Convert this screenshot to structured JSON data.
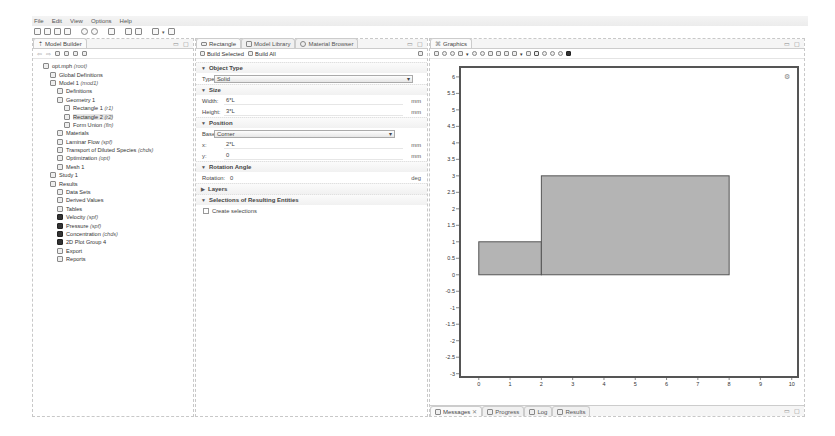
{
  "menu": [
    "File",
    "Edit",
    "View",
    "Options",
    "Help"
  ],
  "toolbar_icons": [
    "new-icon",
    "open-icon",
    "save-icon",
    "print-icon",
    "undo-icon",
    "redo-icon",
    "settings-icon",
    "layout-icon",
    "window-icon",
    "brush-icon",
    "dropdown-icon",
    "grid-icon"
  ],
  "model_builder": {
    "tab": "Model Builder",
    "tree": [
      {
        "label": "opt.mph",
        "tag": "(root)",
        "indent": 0,
        "icon": "root-icon"
      },
      {
        "label": "Global Definitions",
        "tag": "",
        "indent": 1,
        "icon": "global-definitions-icon"
      },
      {
        "label": "Model 1",
        "tag": "(mod1)",
        "indent": 1,
        "icon": "model-icon"
      },
      {
        "label": "Definitions",
        "tag": "",
        "indent": 2,
        "icon": "definitions-icon"
      },
      {
        "label": "Geometry 1",
        "tag": "",
        "indent": 2,
        "icon": "geometry-icon"
      },
      {
        "label": "Rectangle 1",
        "tag": "(r1)",
        "indent": 3,
        "icon": "rectangle-icon"
      },
      {
        "label": "Rectangle 2",
        "tag": "(r2)",
        "indent": 3,
        "icon": "rectangle-icon",
        "selected": true
      },
      {
        "label": "Form Union",
        "tag": "(fin)",
        "indent": 3,
        "icon": "form-union-icon"
      },
      {
        "label": "Materials",
        "tag": "",
        "indent": 2,
        "icon": "materials-icon"
      },
      {
        "label": "Laminar Flow",
        "tag": "(spf)",
        "indent": 2,
        "icon": "laminar-flow-icon"
      },
      {
        "label": "Transport of Diluted Species",
        "tag": "(chds)",
        "indent": 2,
        "icon": "transport-icon"
      },
      {
        "label": "Optimization",
        "tag": "(opt)",
        "indent": 2,
        "icon": "optimization-icon"
      },
      {
        "label": "Mesh 1",
        "tag": "",
        "indent": 2,
        "icon": "mesh-icon"
      },
      {
        "label": "Study 1",
        "tag": "",
        "indent": 1,
        "icon": "study-icon"
      },
      {
        "label": "Results",
        "tag": "",
        "indent": 1,
        "icon": "results-icon"
      },
      {
        "label": "Data Sets",
        "tag": "",
        "indent": 2,
        "icon": "data-sets-icon"
      },
      {
        "label": "Derived Values",
        "tag": "",
        "indent": 2,
        "icon": "derived-values-icon"
      },
      {
        "label": "Tables",
        "tag": "",
        "indent": 2,
        "icon": "tables-icon"
      },
      {
        "label": "Velocity",
        "tag": "(spf)",
        "indent": 2,
        "icon": "plot-group-icon"
      },
      {
        "label": "Pressure",
        "tag": "(spf)",
        "indent": 2,
        "icon": "plot-group-icon"
      },
      {
        "label": "Concentration",
        "tag": "(chds)",
        "indent": 2,
        "icon": "plot-group-icon"
      },
      {
        "label": "2D Plot Group 4",
        "tag": "",
        "indent": 2,
        "icon": "plot-group-icon"
      },
      {
        "label": "Export",
        "tag": "",
        "indent": 2,
        "icon": "export-icon"
      },
      {
        "label": "Reports",
        "tag": "",
        "indent": 2,
        "icon": "reports-icon"
      }
    ]
  },
  "settings": {
    "tabs": [
      "Rectangle",
      "Model Library",
      "Material Browser"
    ],
    "build_selected": "Build Selected",
    "build_all": "Build All",
    "object_type": {
      "title": "Object Type",
      "type_label": "Type:",
      "type_value": "Solid"
    },
    "size": {
      "title": "Size",
      "width_label": "Width:",
      "width_value": "6*L",
      "height_label": "Height:",
      "height_value": "3*L",
      "unit": "mm"
    },
    "position": {
      "title": "Position",
      "base_label": "Base:",
      "base_value": "Corner",
      "x_label": "x:",
      "x_value": "2*L",
      "y_label": "y:",
      "y_value": "0",
      "unit": "mm"
    },
    "rotation": {
      "title": "Rotation Angle",
      "label": "Rotation:",
      "value": "0",
      "unit": "deg"
    },
    "layers": {
      "title": "Layers"
    },
    "selections": {
      "title": "Selections of Resulting Entities",
      "checkbox_label": "Create selections",
      "checked": false
    }
  },
  "graphics": {
    "tab": "Graphics",
    "y_ticks": [
      "6",
      "5.5",
      "5",
      "4.5",
      "4",
      "3.5",
      "3",
      "2.5",
      "2",
      "1.5",
      "1",
      "0.5",
      "0",
      "-0.5",
      "-1",
      "-1.5",
      "-2",
      "-2.5",
      "-3"
    ],
    "x_ticks": [
      "0",
      "1",
      "2",
      "3",
      "4",
      "5",
      "6",
      "7",
      "8",
      "9",
      "10"
    ],
    "rectangles": [
      {
        "name": "r1",
        "x": 0,
        "y": 0,
        "w": 2,
        "h": 1
      },
      {
        "name": "r2",
        "x": 2,
        "y": 0,
        "w": 6,
        "h": 3
      }
    ],
    "fill_color": "#b4b4b4",
    "edge_color": "#555555"
  },
  "bottom_tabs": [
    "Messages",
    "Progress",
    "Log",
    "Results"
  ]
}
